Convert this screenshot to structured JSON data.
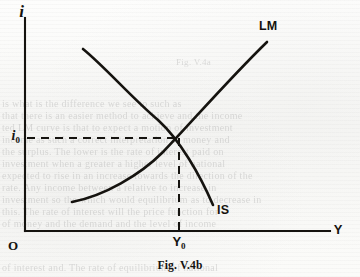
{
  "figure": {
    "caption": "Fig. V.4b",
    "background_color": "#fbfbfa",
    "ink_color": "#15130f"
  },
  "axes": {
    "y_axis_label": "i",
    "x_axis_label": "Y",
    "origin_label": "O",
    "y_axis_x_px": 25,
    "x_axis_y_px": 231,
    "x_axis_end_px": 330,
    "y_axis_top_px": 18
  },
  "ticks": {
    "y": {
      "base": "i",
      "sub": "0",
      "value_px": 138
    },
    "x": {
      "base": "Y",
      "sub": "0",
      "value_px": 179
    }
  },
  "curves": [
    {
      "name": "LM",
      "label": "LM",
      "description": "upward sloping money-market equilibrium curve",
      "path": "M 72 202 C 104 196, 140 175, 163 152 C 190 124, 228 80, 267 42"
    },
    {
      "name": "IS",
      "label": "IS",
      "description": "downward sloping goods-market equilibrium curve",
      "path": "M 83 49 C 104 66, 132 98, 158 120 C 180 140, 200 175, 213 205"
    }
  ],
  "guides": {
    "horizontal_dashed": "M 27 138 L 179 138",
    "vertical_dashed": "M 179 138 L 179 231"
  },
  "equilibrium": {
    "x_px": 179,
    "y_px": 138
  },
  "ghost_text": [
    {
      "text": "Fig. V.4a",
      "x": 176,
      "y": 57,
      "size": 9
    },
    {
      "text": "is what is the difference  we see to such as",
      "x": 2,
      "y": 98,
      "size": 10
    },
    {
      "text": "that there is an easier method to achieve and the income",
      "x": 2,
      "y": 110,
      "size": 10
    },
    {
      "text": "ted LM curve is that to expect a motion of investment",
      "x": 2,
      "y": 122,
      "size": 10
    },
    {
      "text": "income as such a correct interpretation of money and",
      "x": 2,
      "y": 134,
      "size": 10
    },
    {
      "text": "the surplus. The lower is the rate of interest paid on",
      "x": 2,
      "y": 146,
      "size": 10
    },
    {
      "text": "investment when a greater a higher level of national",
      "x": 2,
      "y": 158,
      "size": 10
    },
    {
      "text": "expected to rise in an increase towards the direction of the",
      "x": 2,
      "y": 170,
      "size": 10
    },
    {
      "text": "rate. Any income between a relative to increase in",
      "x": 2,
      "y": 182,
      "size": 10
    },
    {
      "text": "investment so the which would equilibrium as to decrease in",
      "x": 2,
      "y": 194,
      "size": 10
    },
    {
      "text": "this. The rate of interest will the price function for",
      "x": 2,
      "y": 206,
      "size": 10
    },
    {
      "text": "of money and the demand and the level of income",
      "x": 2,
      "y": 218,
      "size": 10
    },
    {
      "text": "of interest and. The rate of equilibrium of national",
      "x": 2,
      "y": 262,
      "size": 10
    }
  ]
}
